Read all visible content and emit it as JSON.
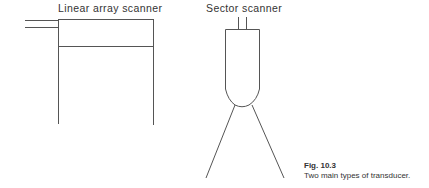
{
  "figure": {
    "linear_label": "Linear array scanner",
    "sector_label": "Sector scanner",
    "caption_title": "Fig. 10.3",
    "caption_text": "Two main types of transducer."
  },
  "colors": {
    "line": "#555555",
    "text": "#333333"
  }
}
